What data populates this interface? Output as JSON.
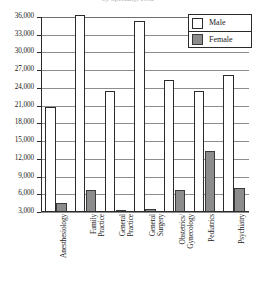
{
  "chart_data": {
    "type": "bar",
    "title": "by Specialty, 1990",
    "xlabel": "",
    "ylabel": "",
    "ylim": [
      3000,
      36000
    ],
    "ytick_step": 3000,
    "yticks": [
      "36,000",
      "33,000",
      "30,000",
      "27,000",
      "24,000",
      "21,000",
      "18,000",
      "15,000",
      "12,000",
      "9,000",
      "6,000",
      "3,000"
    ],
    "ytick_values": [
      36000,
      33000,
      30000,
      27000,
      24000,
      21000,
      18000,
      15000,
      12000,
      9000,
      6000,
      3000
    ],
    "grid": true,
    "legend_position": "top-right",
    "categories": [
      "Anesthesiology",
      "Family Practice",
      "General Practice",
      "General Surgery",
      "Obstetrics/ Gynecology",
      "Pediatrics",
      "Psychiatry"
    ],
    "category_lines": [
      [
        "Anesthesiology"
      ],
      [
        "Family",
        "Practice"
      ],
      [
        "General",
        "Practice"
      ],
      [
        "General",
        "Surgery"
      ],
      [
        "Obstetrics/",
        "Gynecology"
      ],
      [
        "Pediatrics"
      ],
      [
        "Psychiatry"
      ]
    ],
    "series": [
      {
        "name": "Male",
        "color": "#ffffff",
        "values": [
          20700,
          36300,
          23500,
          35400,
          25400,
          23500,
          26200
        ]
      },
      {
        "name": "Female",
        "color": "#8c8c8c",
        "values": [
          4500,
          6800,
          2800,
          3500,
          6700,
          13300,
          7000
        ]
      }
    ]
  },
  "legend": {
    "items": [
      {
        "label": "Male",
        "key": "male"
      },
      {
        "label": "Female",
        "key": "female"
      }
    ]
  }
}
